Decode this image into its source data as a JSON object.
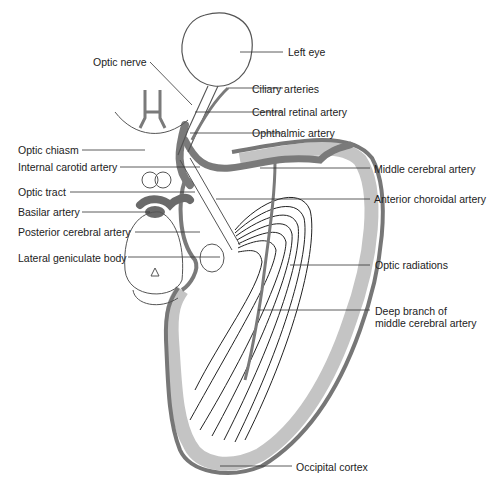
{
  "diagram": {
    "colors": {
      "artery": "#7a7a7a",
      "cortex": "#c4c4c4",
      "outline": "#555555",
      "leader": "#333333",
      "text": "#222222"
    },
    "labels_left": [
      {
        "id": "optic-nerve",
        "text": "Optic nerve"
      },
      {
        "id": "optic-chiasm",
        "text": "Optic chiasm"
      },
      {
        "id": "internal-carotid-artery",
        "text": "Internal carotid artery"
      },
      {
        "id": "optic-tract",
        "text": "Optic tract"
      },
      {
        "id": "basilar-artery",
        "text": "Basilar artery"
      },
      {
        "id": "posterior-cerebral-artery",
        "text": "Posterior cerebral artery"
      },
      {
        "id": "lateral-geniculate-body",
        "text": "Lateral geniculate body"
      }
    ],
    "labels_right": [
      {
        "id": "left-eye",
        "text": "Left eye"
      },
      {
        "id": "ciliary-arteries",
        "text": "Ciliary arteries"
      },
      {
        "id": "central-retinal-artery",
        "text": "Central retinal artery"
      },
      {
        "id": "ophthalmic-artery",
        "text": "Ophthalmic artery"
      },
      {
        "id": "middle-cerebral-artery",
        "text": "Middle cerebral artery"
      },
      {
        "id": "anterior-choroidal-artery",
        "text": "Anterior choroidal artery"
      },
      {
        "id": "optic-radiations",
        "text": "Optic radiations"
      },
      {
        "id": "deep-branch-line1",
        "text": "Deep branch of"
      },
      {
        "id": "deep-branch-line2",
        "text": "middle cerebral artery"
      },
      {
        "id": "occipital-cortex",
        "text": "Occipital cortex"
      }
    ]
  }
}
